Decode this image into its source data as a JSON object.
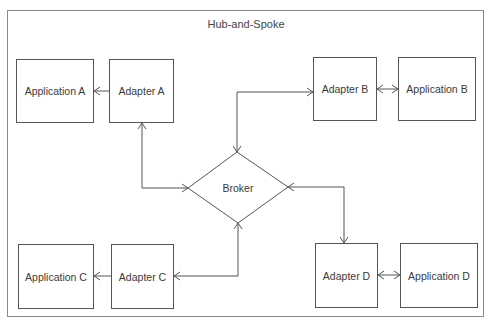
{
  "diagram": {
    "title": "Hub-and-Spoke",
    "hub": {
      "label": "Broker",
      "shape": "diamond"
    },
    "nodes": {
      "application_a": "Application A",
      "adapter_a": "Adapter A",
      "adapter_b": "Adapter B",
      "application_b": "Application B",
      "application_c": "Application C",
      "adapter_c": "Adapter C",
      "adapter_d": "Adapter D",
      "application_d": "Application D"
    },
    "edges": [
      {
        "from": "Adapter A",
        "to": "Application A",
        "arrow": "to"
      },
      {
        "from": "Adapter A",
        "to": "Broker",
        "arrow": "both"
      },
      {
        "from": "Broker",
        "to": "Adapter B",
        "arrow": "both"
      },
      {
        "from": "Adapter B",
        "to": "Application B",
        "arrow": "both"
      },
      {
        "from": "Broker",
        "to": "Adapter C",
        "arrow": "both"
      },
      {
        "from": "Adapter C",
        "to": "Application C",
        "arrow": "to"
      },
      {
        "from": "Broker",
        "to": "Adapter D",
        "arrow": "both"
      },
      {
        "from": "Adapter D",
        "to": "Application D",
        "arrow": "both"
      }
    ],
    "colors": {
      "stroke": "#555555",
      "frame": "#8a8a8a",
      "text": "#3a3a3a",
      "background": "#ffffff"
    }
  }
}
